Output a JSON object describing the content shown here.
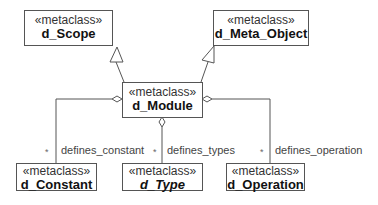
{
  "diagram": {
    "type": "uml-class-diagram",
    "classes": {
      "scope": {
        "stereotype": "«metaclass»",
        "name": "d_Scope"
      },
      "meta_object": {
        "stereotype": "«metaclass»",
        "name": "d_Meta_Object"
      },
      "module": {
        "stereotype": "«metaclass»",
        "name": "d_Module"
      },
      "constant": {
        "stereotype": "«metaclass»",
        "name": "d_Constant"
      },
      "type": {
        "stereotype": "«metaclass»",
        "name": "d_Type",
        "abstract": true
      },
      "operation": {
        "stereotype": "«metaclass»",
        "name": "d_Operation"
      }
    },
    "generalizations": [
      {
        "from": "d_Module",
        "to": "d_Scope"
      },
      {
        "from": "d_Module",
        "to": "d_Meta_Object"
      }
    ],
    "aggregations": [
      {
        "whole": "d_Module",
        "part": "d_Constant",
        "role": "defines_constant",
        "multiplicity": "*"
      },
      {
        "whole": "d_Module",
        "part": "d_Type",
        "role": "defines_types",
        "multiplicity": "*"
      },
      {
        "whole": "d_Module",
        "part": "d_Operation",
        "role": "defines_operation",
        "multiplicity": "*"
      }
    ]
  }
}
